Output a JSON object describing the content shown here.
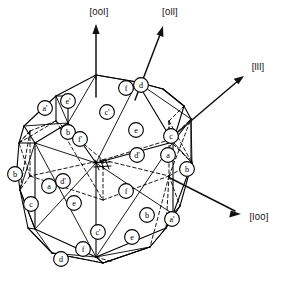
{
  "figure": {
    "background_color": "#ffffff",
    "line_color": "#000000"
  },
  "axes": [
    {
      "id": "axis-001",
      "label": "[00l]",
      "label_x": 99,
      "label_y": 11,
      "x1": 96,
      "y1": 97,
      "x2": 96,
      "y2": 26
    },
    {
      "id": "axis-011",
      "label": "[0ll]",
      "label_x": 170,
      "label_y": 11,
      "x1": 135,
      "y1": 100,
      "x2": 163,
      "y2": 27
    },
    {
      "id": "axis-111",
      "label": "[lll]",
      "label_x": 258,
      "label_y": 66,
      "x1": 172,
      "y1": 137,
      "x2": 243,
      "y2": 76
    },
    {
      "id": "axis-100",
      "label": "[l00]",
      "label_x": 259,
      "label_y": 216,
      "x1": 170,
      "y1": 178,
      "x2": 240,
      "y2": 214
    }
  ],
  "nodes": [
    {
      "id": "n1",
      "label": "a'",
      "cx": 45,
      "cy": 108
    },
    {
      "id": "n2",
      "label": "e'",
      "cx": 68,
      "cy": 101
    },
    {
      "id": "n3",
      "label": "c'",
      "cx": 107,
      "cy": 112
    },
    {
      "id": "n4",
      "label": "f",
      "cx": 126,
      "cy": 88
    },
    {
      "id": "n5",
      "label": "d",
      "cx": 141,
      "cy": 85
    },
    {
      "id": "n6",
      "label": "b",
      "cx": 68,
      "cy": 132
    },
    {
      "id": "n7",
      "label": "f'",
      "cx": 80,
      "cy": 139
    },
    {
      "id": "n8",
      "label": "e",
      "cx": 136,
      "cy": 130
    },
    {
      "id": "n9",
      "label": "c",
      "cx": 171,
      "cy": 136
    },
    {
      "id": "n10",
      "label": "d'",
      "cx": 137,
      "cy": 155
    },
    {
      "id": "n11",
      "label": "a",
      "cx": 168,
      "cy": 155
    },
    {
      "id": "n12",
      "label": "b",
      "cx": 187,
      "cy": 169
    },
    {
      "id": "n13",
      "label": "b",
      "cx": 15,
      "cy": 174
    },
    {
      "id": "n14",
      "label": "d'",
      "cx": 63,
      "cy": 181
    },
    {
      "id": "n15",
      "label": "a",
      "cx": 49,
      "cy": 186
    },
    {
      "id": "n16",
      "label": "f",
      "cx": 126,
      "cy": 191
    },
    {
      "id": "n17",
      "label": "c",
      "cx": 31,
      "cy": 204
    },
    {
      "id": "n18",
      "label": "e",
      "cx": 74,
      "cy": 203
    },
    {
      "id": "n19",
      "label": "b",
      "cx": 147,
      "cy": 215
    },
    {
      "id": "n20",
      "label": "a'",
      "cx": 172,
      "cy": 219
    },
    {
      "id": "n21",
      "label": "e",
      "cx": 132,
      "cy": 237
    },
    {
      "id": "n22",
      "label": "c'",
      "cx": 98,
      "cy": 232
    },
    {
      "id": "n23",
      "label": "f",
      "cx": 83,
      "cy": 249
    },
    {
      "id": "n24",
      "label": "d",
      "cx": 61,
      "cy": 259
    }
  ],
  "center_mark": {
    "id": "hatch-marks",
    "cx": 102,
    "cy": 165,
    "count": 4
  }
}
